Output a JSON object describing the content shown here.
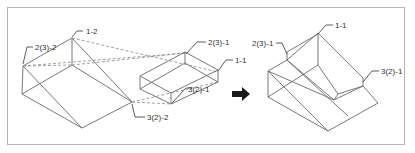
{
  "figure": {
    "labels": {
      "left_2_3_2": "2(3)-2",
      "left_1_2": "1-2",
      "left_3_2_2": "3(2)-2",
      "mid_2_3_1": "2(3)-1",
      "mid_1_1": "1-1",
      "mid_3_2_1": "3(2)-1",
      "right_1_1": "1-1",
      "right_2_3_1": "2(3)-1",
      "right_3_2_1": "3(2)-1"
    },
    "arrow": "right-arrow",
    "colors": {
      "line": "#6a6a6a",
      "frame": "#b5b5b5",
      "arrow": "#1a1a1a",
      "text": "#333333"
    }
  }
}
